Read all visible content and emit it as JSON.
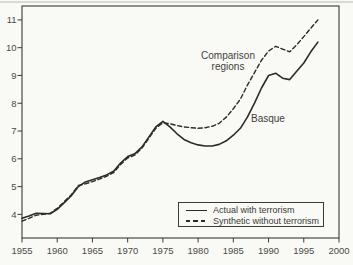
{
  "colors": {
    "line_ink": "#2b2b28",
    "frame": "#3a3a38",
    "tick_text": "#4b4b44",
    "background": "#f9f9f6"
  },
  "chart_data": {
    "type": "line",
    "title": "",
    "xlabel": "",
    "ylabel": "",
    "xlim": [
      1955,
      2000
    ],
    "ylim": [
      3.15,
      11.5
    ],
    "x_ticks": [
      1955,
      1960,
      1965,
      1970,
      1975,
      1980,
      1985,
      1990,
      1995,
      2000
    ],
    "y_ticks": [
      4,
      5,
      6,
      7,
      8,
      9,
      10,
      11
    ],
    "grid": false,
    "legend_position": "bottom-right",
    "x": [
      1955,
      1956,
      1957,
      1958,
      1959,
      1960,
      1961,
      1962,
      1963,
      1964,
      1965,
      1966,
      1967,
      1968,
      1969,
      1970,
      1971,
      1972,
      1973,
      1974,
      1975,
      1976,
      1977,
      1978,
      1979,
      1980,
      1981,
      1982,
      1983,
      1984,
      1985,
      1986,
      1987,
      1988,
      1989,
      1990,
      1991,
      1992,
      1993,
      1994,
      1995,
      1996,
      1997
    ],
    "series": [
      {
        "name": "Actual with terrorism",
        "style": "solid",
        "values": [
          3.86,
          3.94,
          4.04,
          4.03,
          4.02,
          4.18,
          4.42,
          4.67,
          5.0,
          5.17,
          5.25,
          5.33,
          5.42,
          5.55,
          5.85,
          6.08,
          6.18,
          6.42,
          6.78,
          7.15,
          7.35,
          7.15,
          6.9,
          6.7,
          6.58,
          6.5,
          6.46,
          6.46,
          6.52,
          6.65,
          6.85,
          7.1,
          7.5,
          8.0,
          8.55,
          9.0,
          9.08,
          8.9,
          8.85,
          9.15,
          9.45,
          9.85,
          10.2
        ]
      },
      {
        "name": "Synthetic without terrorism",
        "style": "dashed",
        "values": [
          3.76,
          3.86,
          3.97,
          4.0,
          4.04,
          4.22,
          4.46,
          4.71,
          5.04,
          5.1,
          5.18,
          5.27,
          5.37,
          5.5,
          5.8,
          6.03,
          6.13,
          6.38,
          6.74,
          7.1,
          7.3,
          7.26,
          7.2,
          7.15,
          7.12,
          7.1,
          7.12,
          7.17,
          7.28,
          7.5,
          7.8,
          8.15,
          8.65,
          9.1,
          9.55,
          9.88,
          10.05,
          9.95,
          9.85,
          10.1,
          10.4,
          10.7,
          11.0
        ]
      }
    ],
    "annotations": [
      {
        "text": "Comparison regions",
        "anchor_year": 1984,
        "anchor_value": 9.5,
        "series": "Synthetic without terrorism"
      },
      {
        "text": "Basque",
        "anchor_year": 1990,
        "anchor_value": 7.4,
        "series": "Actual with terrorism"
      }
    ]
  },
  "legend": {
    "items": [
      {
        "label": "Actual with terrorism",
        "style": "solid"
      },
      {
        "label": "Synthetic without terrorism",
        "style": "dashed"
      }
    ]
  }
}
